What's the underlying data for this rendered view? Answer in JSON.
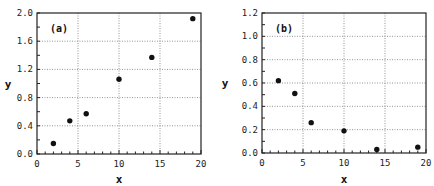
{
  "chart_data": [
    {
      "type": "scatter",
      "panel_label": "(a)",
      "xlabel": "x",
      "ylabel": "y",
      "xlim": [
        0,
        20
      ],
      "ylim": [
        0,
        2.0
      ],
      "xticks": [
        "0",
        "5",
        "10",
        "15",
        "20"
      ],
      "yticks": [
        "0.0",
        "0.4",
        "0.8",
        "1.2",
        "1.6",
        "2.0"
      ],
      "grid": true,
      "legend": null,
      "x": [
        2,
        4,
        6,
        10,
        14,
        19
      ],
      "y": [
        0.15,
        0.47,
        0.57,
        1.06,
        1.37,
        1.92
      ]
    },
    {
      "type": "scatter",
      "panel_label": "(b)",
      "xlabel": "x",
      "ylabel": "y",
      "xlim": [
        0,
        20
      ],
      "ylim": [
        0,
        1.2
      ],
      "xticks": [
        "0",
        "5",
        "10",
        "15",
        "20"
      ],
      "yticks": [
        "0.0",
        "0.2",
        "0.4",
        "0.6",
        "0.8",
        "1.0",
        "1.2"
      ],
      "grid": true,
      "legend": null,
      "x": [
        2,
        4,
        6,
        10,
        14,
        19
      ],
      "y": [
        0.62,
        0.51,
        0.26,
        0.19,
        0.03,
        0.05
      ]
    }
  ]
}
